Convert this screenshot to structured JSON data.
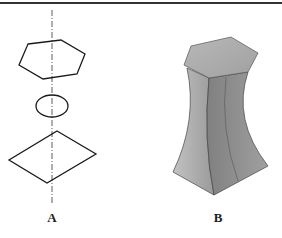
{
  "figure": {
    "panels": [
      {
        "id": "A",
        "label": "A",
        "description": "Exploded axial view: hexagon, ellipse, rhombus on dash-dot axis"
      },
      {
        "id": "B",
        "label": "B",
        "description": "3D solid transitioning from hexagonal top to square base with concave sides"
      }
    ],
    "colors": {
      "line": "#1a1a1a",
      "top_face": "#a8a8a8",
      "left_face": "#b4b4b4",
      "right_face": "#8a8a8a",
      "mid_face": "#9c9c9c"
    }
  }
}
